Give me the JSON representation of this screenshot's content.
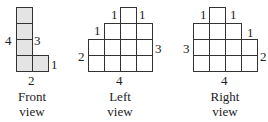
{
  "cell_size": 16,
  "views": [
    {
      "id": "front",
      "caption_line1": "Front",
      "caption_line2": "view",
      "origin_x": 16,
      "base_y": 71,
      "column_heights": [
        4,
        1
      ],
      "fill": "#e4e4e4",
      "labels": [
        {
          "text": "4",
          "x": 5,
          "y": 34
        },
        {
          "text": "3",
          "x": 34,
          "y": 34
        },
        {
          "text": "1",
          "x": 51,
          "y": 58
        },
        {
          "text": "2",
          "x": 28,
          "y": 74
        }
      ],
      "caption_x": 2
    },
    {
      "id": "left",
      "caption_line1": "Left",
      "caption_line2": "view",
      "origin_x": 88,
      "base_y": 71,
      "column_heights": [
        2,
        3,
        4,
        3
      ],
      "fill": "#ffffff",
      "labels": [
        {
          "text": "2",
          "x": 78,
          "y": 50
        },
        {
          "text": "1",
          "x": 94,
          "y": 24
        },
        {
          "text": "1",
          "x": 111,
          "y": 8
        },
        {
          "text": "1",
          "x": 139,
          "y": 8
        },
        {
          "text": "3",
          "x": 155,
          "y": 42
        },
        {
          "text": "4",
          "x": 116,
          "y": 74
        }
      ],
      "caption_x": 90
    },
    {
      "id": "right",
      "caption_line1": "Right",
      "caption_line2": "view",
      "origin_x": 193,
      "base_y": 71,
      "column_heights": [
        3,
        4,
        3,
        2
      ],
      "fill": "#ffffff",
      "labels": [
        {
          "text": "1",
          "x": 200,
          "y": 8
        },
        {
          "text": "1",
          "x": 230,
          "y": 8
        },
        {
          "text": "1",
          "x": 247,
          "y": 26
        },
        {
          "text": "3",
          "x": 183,
          "y": 42
        },
        {
          "text": "2",
          "x": 260,
          "y": 50
        },
        {
          "text": "4",
          "x": 221,
          "y": 74
        }
      ],
      "caption_x": 195
    }
  ]
}
